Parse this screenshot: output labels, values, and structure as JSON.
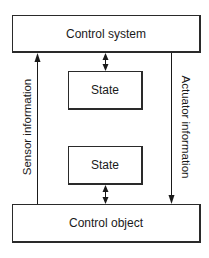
{
  "diagram": {
    "boxes": {
      "control_system": "Control system",
      "state_top": "State",
      "state_bottom": "State",
      "control_object": "Control object"
    },
    "edges": {
      "sensor": "Sensor information",
      "actuator": "Actuator information"
    },
    "connections": [
      {
        "from": "control_object",
        "to": "control_system",
        "label": "Sensor information",
        "direction": "up"
      },
      {
        "from": "control_system",
        "to": "control_object",
        "label": "Actuator information",
        "direction": "down"
      },
      {
        "from": "control_system",
        "to": "state_top",
        "direction": "bidirectional"
      },
      {
        "from": "state_bottom",
        "to": "control_object",
        "direction": "bidirectional"
      }
    ]
  }
}
